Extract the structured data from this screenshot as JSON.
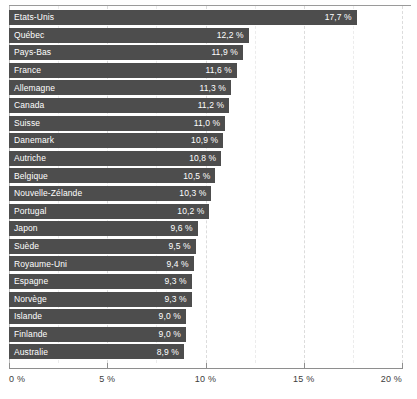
{
  "chart_data": {
    "type": "bar",
    "orientation": "horizontal",
    "title": "",
    "subtitle": "",
    "xlabel": "",
    "ylabel": "",
    "xlim": [
      0,
      20
    ],
    "unit": "%",
    "grid": true,
    "legend": null,
    "x_tick_labels": [
      "0 %",
      "5 %",
      "10 %",
      "15 %",
      "20 %"
    ],
    "x_ticks": [
      0,
      5,
      10,
      15,
      20
    ],
    "minor_gridlines": [
      2.5,
      7.5,
      12.5,
      17.5
    ],
    "categories": [
      "Etats-Unis",
      "Québec",
      "Pays-Bas",
      "France",
      "Allemagne",
      "Canada",
      "Suisse",
      "Danemark",
      "Autriche",
      "Belgique",
      "Nouvelle-Zélande",
      "Portugal",
      "Japon",
      "Suède",
      "Royaume-Uni",
      "Espagne",
      "Norvège",
      "Islande",
      "Finlande",
      "Australie"
    ],
    "values": [
      17.7,
      12.2,
      11.9,
      11.6,
      11.3,
      11.2,
      11.0,
      10.9,
      10.8,
      10.5,
      10.3,
      10.2,
      9.6,
      9.5,
      9.4,
      9.3,
      9.3,
      9.0,
      9.0,
      8.9
    ],
    "value_labels": [
      "17,7 %",
      "12,2 %",
      "11,9 %",
      "11,6 %",
      "11,3 %",
      "11,2 %",
      "11,0 %",
      "10,9 %",
      "10,8 %",
      "10,5 %",
      "10,3 %",
      "10,2 %",
      "9,6 %",
      "9,5 %",
      "9,4 %",
      "9,3 %",
      "9,3 %",
      "9,0 %",
      "9,0 %",
      "8,9 %"
    ],
    "bar_color": "#4d4d4d",
    "bar_label_color": "#ffffff",
    "gridline_color": "#dcdcdc",
    "axis_color": "#8e8e8e"
  }
}
